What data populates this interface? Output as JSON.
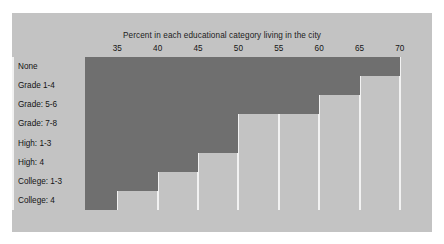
{
  "figure": {
    "background_color": "#c3c3c3",
    "page_background_color": "#ffffff",
    "bar_color": "#6f6f6f",
    "gridline_color": "#f2f2f2",
    "text_color": "#141414"
  },
  "chart_data": {
    "type": "bar",
    "orientation": "horizontal",
    "title": "Percent in each educational category living in the city",
    "xlabel": "",
    "ylabel": "",
    "categories": [
      "None",
      "Grade 1-4",
      "Grade: 5-6",
      "Grade: 7-8",
      "High: 1-3",
      "High: 4",
      "College: 1-3",
      "College: 4"
    ],
    "values": [
      70,
      65,
      60,
      50,
      50,
      45,
      40,
      35
    ],
    "xlim": [
      31,
      71.5
    ],
    "xticks": [
      35,
      40,
      45,
      50,
      55,
      60,
      65,
      70
    ],
    "xticklabels": [
      "35",
      "40",
      "45",
      "50",
      "55",
      "60",
      "65",
      "70"
    ],
    "grid": true,
    "grid_axis": "x",
    "legend": false,
    "axis_position": "top"
  }
}
